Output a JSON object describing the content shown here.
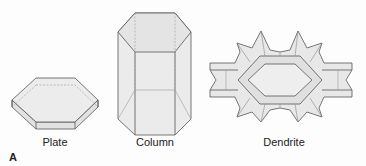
{
  "figure": {
    "panel_label": "A",
    "crystals": [
      {
        "id": "plate",
        "label": "Plate"
      },
      {
        "id": "column",
        "label": "Column"
      },
      {
        "id": "dendrite",
        "label": "Dendrite"
      }
    ]
  },
  "colors": {
    "face_fill": "#e6e6e6",
    "face_light": "#efefef",
    "edge": "#555555",
    "hidden_edge": "#9a9a9a"
  }
}
